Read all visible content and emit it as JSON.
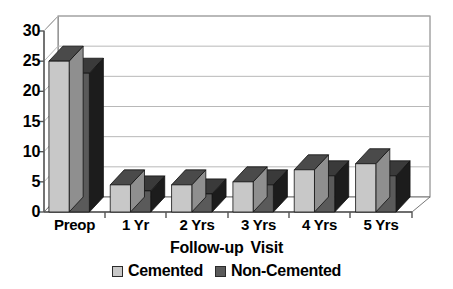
{
  "chart_data": {
    "type": "bar",
    "title": "",
    "subtitle": "",
    "xlabel": "Follow-up  Visit",
    "ylabel": "",
    "ylim": [
      0,
      30
    ],
    "yticks": [
      0,
      5,
      10,
      15,
      20,
      25,
      30
    ],
    "grid": true,
    "three_d": true,
    "legend_position": "bottom",
    "categories": [
      "Preop",
      "1 Yr",
      "2 Yrs",
      "3 Yrs",
      "4 Yrs",
      "5 Yrs"
    ],
    "series": [
      {
        "name": "Cemented",
        "color": "#c8c8c8",
        "values": [
          25,
          4.5,
          4.5,
          5,
          7,
          8
        ]
      },
      {
        "name": "Non-Cemented",
        "color": "#5a5a5a",
        "values": [
          23,
          3.5,
          3,
          4.5,
          6,
          6
        ]
      }
    ]
  },
  "axis": {
    "y_tick_labels": [
      "30",
      "25",
      "20",
      "15",
      "10",
      "5",
      "0"
    ],
    "x_tick_labels": [
      "Preop",
      "1 Yr",
      "2 Yrs",
      "3 Yrs",
      "4 Yrs",
      "5 Yrs"
    ],
    "x_title_part1": "Follow-up",
    "x_title_part2": "Visit"
  },
  "legend": {
    "items": [
      {
        "label": "Cemented",
        "color": "#c8c8c8"
      },
      {
        "label": "Non-Cemented",
        "color": "#5a5a5a"
      }
    ]
  },
  "colors": {
    "series_cemented_front": "#c8c8c8",
    "series_cemented_top": "#4a4a4a",
    "series_cemented_side": "#8f8f8f",
    "series_noncemented_front": "#5a5a5a",
    "series_noncemented_top": "#3a3a3a",
    "series_noncemented_side": "#1c1c1c",
    "gridline": "#b4b4b4",
    "axis": "#555555",
    "background": "#ffffff",
    "text": "#000000"
  }
}
